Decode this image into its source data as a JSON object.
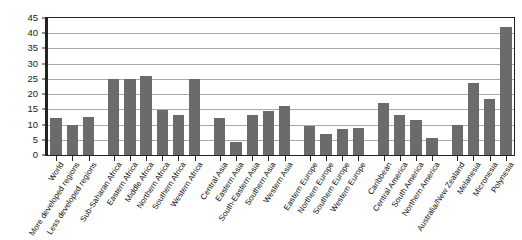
{
  "chart_data": {
    "type": "bar",
    "title": "",
    "subtitle": "",
    "xlabel": "",
    "ylabel": "",
    "ylim": [
      0,
      45
    ],
    "ytick_step": 5,
    "yticks": [
      "0",
      "5",
      "10",
      "15",
      "20",
      "25",
      "30",
      "35",
      "40",
      "45"
    ],
    "grid": true,
    "legend": false,
    "legend_position": "none",
    "bar_color": "#6b6b6b",
    "gridline_color": "#a9a9a9",
    "axis_color": "#222222",
    "categories": [
      "World",
      "More developed regions",
      "Less developed regions",
      "Sub-Saharan Africa",
      "Eastern Africa",
      "Middle Africa",
      "Northern Africa",
      "Southern Africa",
      "Western Africa",
      "Central Asia",
      "Eastern Asia",
      "South-Eastern Asia",
      "Southern Asia",
      "Western Asia",
      "Eastern Europe",
      "Northern Europe",
      "Southern Europe",
      "Western Europe",
      "Caribbean",
      "Central America",
      "South America",
      "Northern America",
      "Australia/New Zealand",
      "Melanesia",
      "Micronesia",
      "Polynesia"
    ],
    "values": [
      12.0,
      9.7,
      12.5,
      25.0,
      25.0,
      26.0,
      14.8,
      13.3,
      25.0,
      12.3,
      4.2,
      13.0,
      14.5,
      16.0,
      9.5,
      7.0,
      8.5,
      9.0,
      17.0,
      13.0,
      11.5,
      5.5,
      10.0,
      23.5,
      18.5,
      42.0
    ],
    "gaps_after": [
      2,
      8,
      13,
      17,
      21
    ]
  }
}
